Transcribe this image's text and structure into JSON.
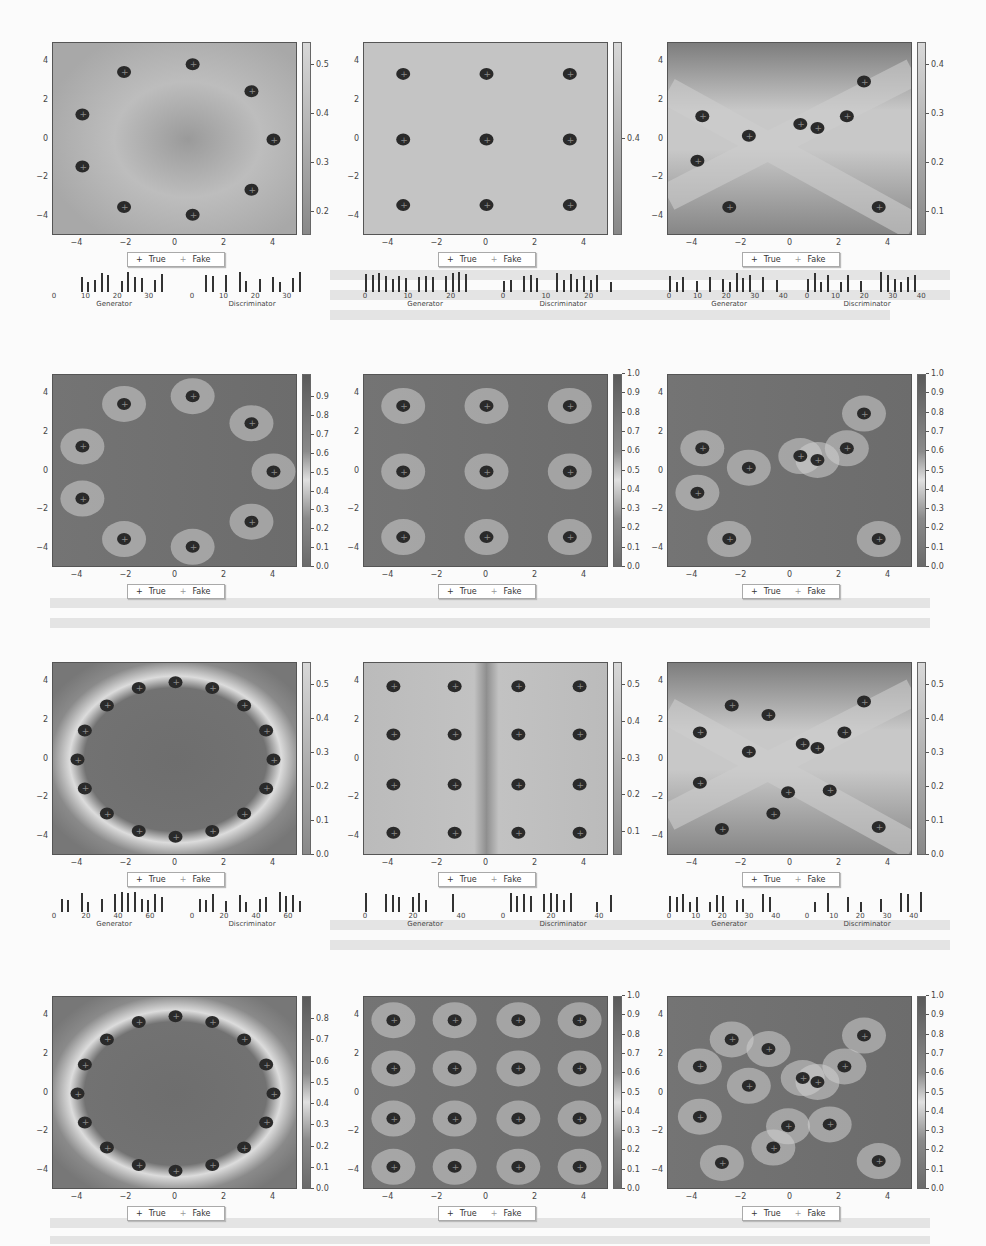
{
  "figure": {
    "legend": {
      "true_label": "True",
      "fake_label": "Fake",
      "true_marker": "+",
      "fake_marker": "+"
    },
    "x_ticks": [
      "−4",
      "−2",
      "0",
      "2",
      "4"
    ],
    "y_ticks": [
      "4",
      "2",
      "0",
      "−2",
      "−4"
    ],
    "hist_labels": {
      "generator": "Generator",
      "discriminator": "Discriminator"
    }
  },
  "chart_data": [
    {
      "type": "heatmap",
      "row": 1,
      "col": 1,
      "title": "",
      "xlim": [
        -5,
        5
      ],
      "ylim": [
        -5,
        5
      ],
      "pattern": "ring-8",
      "colorbar_ticks": [
        "0.5",
        "0.4",
        "0.3",
        "0.2"
      ],
      "colorbar_range": [
        0.13,
        0.52
      ],
      "field": "light-center-dark",
      "hist": {
        "generator": {
          "ticks": [
            "0",
            "10",
            "20",
            "30"
          ],
          "max": 38
        },
        "discriminator": {
          "ticks": [
            "0",
            "10",
            "20",
            "30"
          ],
          "max": 38
        }
      }
    },
    {
      "type": "heatmap",
      "row": 1,
      "col": 2,
      "xlim": [
        -5,
        5
      ],
      "ylim": [
        -5,
        5
      ],
      "pattern": "grid-3x3",
      "colorbar_ticks": [
        "0.4"
      ],
      "colorbar_range": [
        0.38,
        0.42
      ],
      "field": "uniform",
      "hist": {
        "generator": {
          "ticks": [
            "0",
            "10",
            "20"
          ],
          "max": 28
        },
        "discriminator": {
          "ticks": [
            "0",
            "10",
            "20"
          ],
          "max": 28
        }
      }
    },
    {
      "type": "heatmap",
      "row": 1,
      "col": 3,
      "xlim": [
        -5,
        5
      ],
      "ylim": [
        -5,
        5
      ],
      "pattern": "scattered-10",
      "colorbar_ticks": [
        "0.4",
        "0.3",
        "0.2",
        "0.1"
      ],
      "colorbar_range": [
        0.01,
        0.46
      ],
      "field": "x-shape-light",
      "hist": {
        "generator": {
          "ticks": [
            "0",
            "10",
            "20",
            "30",
            "40"
          ],
          "max": 42
        },
        "discriminator": {
          "ticks": [
            "0",
            "10",
            "20",
            "30",
            "40"
          ],
          "max": 42
        }
      }
    },
    {
      "type": "heatmap",
      "row": 2,
      "col": 1,
      "xlim": [
        -5,
        5
      ],
      "ylim": [
        -5,
        5
      ],
      "pattern": "ring-8",
      "colorbar_ticks": [
        "0.9",
        "0.8",
        "0.7",
        "0.6",
        "0.5",
        "0.4",
        "0.3",
        "0.2",
        "0.1",
        "0.0"
      ],
      "colorbar_range": [
        0,
        1
      ],
      "field": "dark-with-light-rays"
    },
    {
      "type": "heatmap",
      "row": 2,
      "col": 2,
      "xlim": [
        -5,
        5
      ],
      "ylim": [
        -5,
        5
      ],
      "pattern": "grid-3x3",
      "colorbar_ticks": [
        "1.0",
        "0.9",
        "0.8",
        "0.7",
        "0.6",
        "0.5",
        "0.4",
        "0.3",
        "0.2",
        "0.1",
        "0.0"
      ],
      "colorbar_range": [
        0,
        1
      ],
      "field": "dark-with-light-rays"
    },
    {
      "type": "heatmap",
      "row": 2,
      "col": 3,
      "xlim": [
        -5,
        5
      ],
      "ylim": [
        -5,
        5
      ],
      "pattern": "scattered-10",
      "colorbar_ticks": [
        "1.0",
        "0.9",
        "0.8",
        "0.7",
        "0.6",
        "0.5",
        "0.4",
        "0.3",
        "0.2",
        "0.1",
        "0.0"
      ],
      "colorbar_range": [
        0,
        1
      ],
      "field": "dark-with-light-curves"
    },
    {
      "type": "heatmap",
      "row": 3,
      "col": 1,
      "xlim": [
        -5,
        5
      ],
      "ylim": [
        -5,
        5
      ],
      "pattern": "ring-16",
      "colorbar_ticks": [
        "0.5",
        "0.4",
        "0.3",
        "0.2",
        "0.1",
        "0.0"
      ],
      "colorbar_range": [
        0,
        0.55
      ],
      "field": "dark-with-light-ring",
      "hist": {
        "generator": {
          "ticks": [
            "0",
            "20",
            "40",
            "60"
          ],
          "max": 75
        },
        "discriminator": {
          "ticks": [
            "0",
            "20",
            "40",
            "60"
          ],
          "max": 75
        }
      }
    },
    {
      "type": "heatmap",
      "row": 3,
      "col": 2,
      "xlim": [
        -5,
        5
      ],
      "ylim": [
        -5,
        5
      ],
      "pattern": "grid-4x4",
      "colorbar_ticks": [
        "0.5",
        "0.4",
        "0.3",
        "0.2",
        "0.1"
      ],
      "colorbar_range": [
        0.07,
        0.55
      ],
      "field": "light-with-dark-cross",
      "hist": {
        "generator": {
          "ticks": [
            "0",
            "20",
            "40"
          ],
          "max": 50
        },
        "discriminator": {
          "ticks": [
            "0",
            "20",
            "40"
          ],
          "max": 50
        }
      }
    },
    {
      "type": "heatmap",
      "row": 3,
      "col": 3,
      "xlim": [
        -5,
        5
      ],
      "ylim": [
        -5,
        5
      ],
      "pattern": "scattered-16",
      "colorbar_ticks": [
        "0.5",
        "0.4",
        "0.3",
        "0.2",
        "0.1",
        "0.0"
      ],
      "colorbar_range": [
        0,
        0.55
      ],
      "field": "x-shape-light",
      "hist": {
        "generator": {
          "ticks": [
            "0",
            "10",
            "20",
            "30",
            "40"
          ],
          "max": 45
        },
        "discriminator": {
          "ticks": [
            "0",
            "10",
            "20",
            "30",
            "40"
          ],
          "max": 45
        }
      }
    },
    {
      "type": "heatmap",
      "row": 4,
      "col": 1,
      "xlim": [
        -5,
        5
      ],
      "ylim": [
        -5,
        5
      ],
      "pattern": "ring-16",
      "colorbar_ticks": [
        "0.8",
        "0.7",
        "0.6",
        "0.5",
        "0.4",
        "0.3",
        "0.2",
        "0.1",
        "0.0"
      ],
      "colorbar_range": [
        0,
        0.86
      ],
      "field": "dark-with-light-ring"
    },
    {
      "type": "heatmap",
      "row": 4,
      "col": 2,
      "xlim": [
        -5,
        5
      ],
      "ylim": [
        -5,
        5
      ],
      "pattern": "grid-4x4",
      "colorbar_ticks": [
        "1.0",
        "0.9",
        "0.8",
        "0.7",
        "0.6",
        "0.5",
        "0.4",
        "0.3",
        "0.2",
        "0.1",
        "0.0"
      ],
      "colorbar_range": [
        0,
        1
      ],
      "field": "dark-with-light-rays"
    },
    {
      "type": "heatmap",
      "row": 4,
      "col": 3,
      "xlim": [
        -5,
        5
      ],
      "ylim": [
        -5,
        5
      ],
      "pattern": "scattered-16",
      "colorbar_ticks": [
        "1.0",
        "0.9",
        "0.8",
        "0.7",
        "0.6",
        "0.5",
        "0.4",
        "0.3",
        "0.2",
        "0.1",
        "0.0"
      ],
      "colorbar_range": [
        0,
        1
      ],
      "field": "dark-with-light-rays"
    }
  ],
  "clusters": {
    "ring-8": [
      [
        0.7,
        3.9
      ],
      [
        -2.1,
        3.5
      ],
      [
        3.1,
        2.5
      ],
      [
        -3.8,
        1.3
      ],
      [
        4,
        0
      ],
      [
        -3.8,
        -1.4
      ],
      [
        3.1,
        -2.6
      ],
      [
        -2.1,
        -3.5
      ],
      [
        0.7,
        -3.9
      ]
    ],
    "grid-3x3": [
      [
        -3.4,
        3.4
      ],
      [
        0,
        3.4
      ],
      [
        3.4,
        3.4
      ],
      [
        -3.4,
        0
      ],
      [
        0,
        0
      ],
      [
        3.4,
        0
      ],
      [
        -3.4,
        -3.4
      ],
      [
        0,
        -3.4
      ],
      [
        3.4,
        -3.4
      ]
    ],
    "scattered-10": [
      [
        3,
        3
      ],
      [
        -3.6,
        1.2
      ],
      [
        2.3,
        1.2
      ],
      [
        0.4,
        0.8
      ],
      [
        1.1,
        0.6
      ],
      [
        -1.7,
        0.2
      ],
      [
        -3.8,
        -1.1
      ],
      [
        -2.5,
        -3.5
      ],
      [
        3.6,
        -3.5
      ]
    ],
    "ring-16": [
      [
        0,
        4
      ],
      [
        1.5,
        3.7
      ],
      [
        2.8,
        2.8
      ],
      [
        3.7,
        1.5
      ],
      [
        4,
        0
      ],
      [
        3.7,
        -1.5
      ],
      [
        2.8,
        -2.8
      ],
      [
        1.5,
        -3.7
      ],
      [
        0,
        -4
      ],
      [
        -1.5,
        -3.7
      ],
      [
        -2.8,
        -2.8
      ],
      [
        -3.7,
        -1.5
      ],
      [
        -4,
        0
      ],
      [
        -3.7,
        1.5
      ],
      [
        -2.8,
        2.8
      ],
      [
        -1.5,
        3.7
      ]
    ],
    "grid-4x4": [
      [
        -3.8,
        3.8
      ],
      [
        -1.3,
        3.8
      ],
      [
        1.3,
        3.8
      ],
      [
        3.8,
        3.8
      ],
      [
        -3.8,
        1.3
      ],
      [
        -1.3,
        1.3
      ],
      [
        1.3,
        1.3
      ],
      [
        3.8,
        1.3
      ],
      [
        -3.8,
        -1.3
      ],
      [
        -1.3,
        -1.3
      ],
      [
        1.3,
        -1.3
      ],
      [
        3.8,
        -1.3
      ],
      [
        -3.8,
        -3.8
      ],
      [
        -1.3,
        -3.8
      ],
      [
        1.3,
        -3.8
      ],
      [
        3.8,
        -3.8
      ]
    ],
    "scattered-16": [
      [
        3,
        3
      ],
      [
        -2.4,
        2.8
      ],
      [
        -0.9,
        2.3
      ],
      [
        -3.7,
        1.4
      ],
      [
        2.2,
        1.4
      ],
      [
        -1.7,
        0.4
      ],
      [
        0.5,
        0.8
      ],
      [
        1.1,
        0.6
      ],
      [
        -3.7,
        -1.2
      ],
      [
        -0.1,
        -1.7
      ],
      [
        1.6,
        -1.6
      ],
      [
        -0.7,
        -2.8
      ],
      [
        -2.8,
        -3.6
      ],
      [
        3.6,
        -3.5
      ]
    ]
  }
}
